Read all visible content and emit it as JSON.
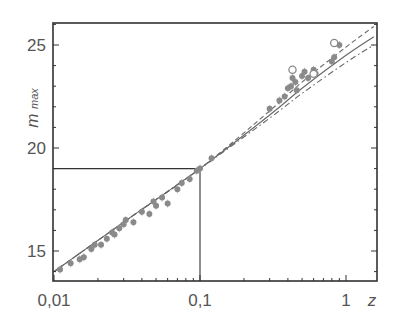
{
  "chart_data": {
    "type": "scatter",
    "title": "",
    "xlabel": "z",
    "ylabel": "m_max",
    "ylabel_main": "m",
    "ylabel_sub": "max",
    "xscale": "log",
    "xlim": [
      0.01,
      1.6
    ],
    "ylim": [
      13.6,
      26.1
    ],
    "grid": false,
    "legend": null,
    "x_ticks": [
      {
        "value": 0.01,
        "label": "0,01"
      },
      {
        "value": 0.1,
        "label": "0,1"
      },
      {
        "value": 1,
        "label": "1"
      }
    ],
    "y_ticks": [
      {
        "value": 15,
        "label": "15"
      },
      {
        "value": 20,
        "label": "20"
      },
      {
        "value": 25,
        "label": "25"
      }
    ],
    "reference_lines": [
      {
        "type": "horizontal",
        "y": 19,
        "x_from": 0.01,
        "x_to": 0.1
      },
      {
        "type": "vertical",
        "x": 0.1,
        "y_from": 13.6,
        "y_to": 19
      }
    ],
    "series": [
      {
        "name": "low-z supernovae",
        "marker": "filled-circle",
        "points": [
          [
            0.011,
            14.1
          ],
          [
            0.013,
            14.4
          ],
          [
            0.015,
            14.6
          ],
          [
            0.016,
            14.7
          ],
          [
            0.018,
            15.1
          ],
          [
            0.019,
            15.3
          ],
          [
            0.021,
            15.3
          ],
          [
            0.023,
            15.6
          ],
          [
            0.025,
            15.9
          ],
          [
            0.026,
            15.8
          ],
          [
            0.028,
            16.1
          ],
          [
            0.03,
            16.3
          ],
          [
            0.031,
            16.5
          ],
          [
            0.035,
            16.4
          ],
          [
            0.04,
            16.9
          ],
          [
            0.045,
            16.8
          ],
          [
            0.048,
            17.4
          ],
          [
            0.05,
            17.2
          ],
          [
            0.055,
            17.6
          ],
          [
            0.06,
            17.3
          ],
          [
            0.07,
            18.0
          ],
          [
            0.075,
            18.3
          ],
          [
            0.085,
            18.5
          ],
          [
            0.095,
            18.9
          ],
          [
            0.1,
            19.0
          ],
          [
            0.12,
            19.5
          ]
        ]
      },
      {
        "name": "high-z supernovae",
        "marker": "filled-circle",
        "points": [
          [
            0.3,
            21.9
          ],
          [
            0.35,
            22.3
          ],
          [
            0.38,
            22.5
          ],
          [
            0.4,
            22.9
          ],
          [
            0.42,
            23.0
          ],
          [
            0.43,
            23.4
          ],
          [
            0.45,
            23.2
          ],
          [
            0.46,
            22.8
          ],
          [
            0.5,
            23.5
          ],
          [
            0.52,
            23.7
          ],
          [
            0.55,
            23.4
          ],
          [
            0.6,
            23.8
          ],
          [
            0.62,
            23.6
          ],
          [
            0.8,
            24.2
          ],
          [
            0.83,
            24.4
          ],
          [
            0.9,
            25.0
          ]
        ]
      },
      {
        "name": "high-z open markers",
        "marker": "open-circle",
        "points": [
          [
            0.43,
            23.8
          ],
          [
            0.6,
            23.6
          ],
          [
            0.83,
            25.1
          ]
        ]
      }
    ],
    "curves": [
      {
        "name": "model-solid",
        "style": "solid",
        "points": [
          [
            0.01,
            14.0
          ],
          [
            0.03,
            16.4
          ],
          [
            0.1,
            19.0
          ],
          [
            0.3,
            21.6
          ],
          [
            0.5,
            22.9
          ],
          [
            1.0,
            24.5
          ],
          [
            1.55,
            25.4
          ]
        ]
      },
      {
        "name": "model-dashed",
        "style": "dashed",
        "points": [
          [
            0.01,
            14.0
          ],
          [
            0.03,
            16.4
          ],
          [
            0.1,
            19.0
          ],
          [
            0.3,
            21.8
          ],
          [
            0.5,
            23.2
          ],
          [
            1.0,
            24.9
          ],
          [
            1.55,
            25.9
          ]
        ]
      },
      {
        "name": "model-dashdot",
        "style": "dash-dot",
        "points": [
          [
            0.01,
            14.0
          ],
          [
            0.03,
            16.4
          ],
          [
            0.1,
            19.0
          ],
          [
            0.3,
            21.45
          ],
          [
            0.5,
            22.65
          ],
          [
            1.0,
            24.15
          ],
          [
            1.55,
            25.0
          ]
        ]
      }
    ]
  },
  "colors": {
    "axis": "#333333",
    "marker": "#8a8a8a",
    "curve": "#666666",
    "text": "#555555"
  }
}
